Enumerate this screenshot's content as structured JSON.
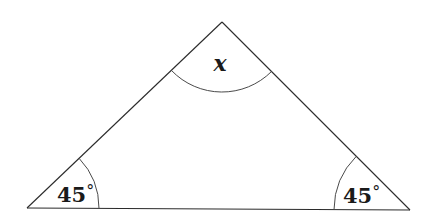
{
  "diagram": {
    "type": "triangle",
    "vertices": {
      "apex": {
        "x": 222,
        "y": 22
      },
      "bottom_left": {
        "x": 27,
        "y": 208
      },
      "bottom_right": {
        "x": 410,
        "y": 210
      }
    },
    "angles": {
      "top": {
        "label": "x",
        "unknown": true
      },
      "bottom_left": {
        "value": "45",
        "unit": "°"
      },
      "bottom_right": {
        "value": "45",
        "unit": "°"
      }
    },
    "colors": {
      "line": "#2b2b2b",
      "arc": "#4a4a4a",
      "text": "#1a1a1a",
      "background": "#ffffff"
    }
  }
}
